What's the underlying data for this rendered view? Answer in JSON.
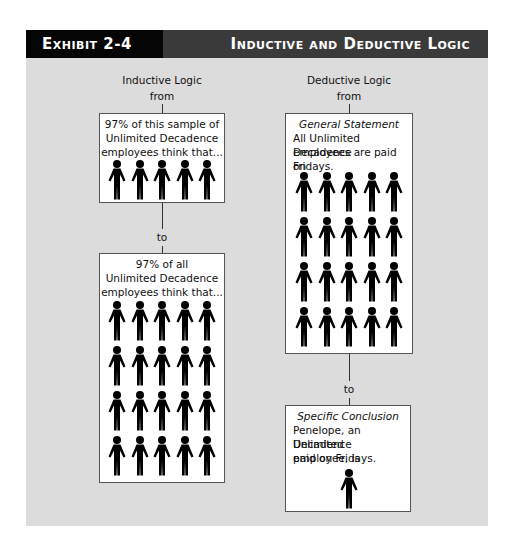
{
  "header": {
    "exhibit_label": "Exhibit 2-4",
    "title": "Inductive and Deductive Logic"
  },
  "inductive": {
    "heading": "Inductive Logic",
    "from_label": "from",
    "to_label": "to",
    "sample_box": {
      "lines": [
        "97% of this sample of",
        "Unlimited Decadence",
        "employees think that..."
      ],
      "figure_count": 5
    },
    "population_box": {
      "lines": [
        "97% of all",
        "Unlimited Decadence",
        "employees think that..."
      ],
      "figure_count": 20
    }
  },
  "deductive": {
    "heading": "Deductive Logic",
    "from_label": "from",
    "to_label": "to",
    "general_box": {
      "title": "General Statement",
      "lines": [
        "All Unlimited Decadence",
        "employees are paid on",
        "Fridays."
      ],
      "figure_count": 20
    },
    "specific_box": {
      "title": "Specific Conclusion",
      "lines": [
        "Penelope, an Unlimited",
        "Decadence employee, is",
        "paid on Fridays."
      ],
      "figure_count": 1
    }
  },
  "colors": {
    "panel_bg": "#dcdcdc",
    "header_left": "#050505",
    "header_right": "#3a3a3a",
    "figure": "#000000"
  }
}
